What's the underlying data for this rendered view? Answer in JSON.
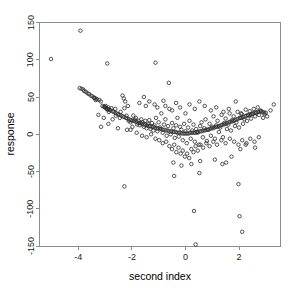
{
  "chart_data": {
    "type": "scatter",
    "title": "True index vs Response",
    "xlabel": "second index",
    "ylabel": "response",
    "xlim": [
      -5.45,
      3.55
    ],
    "ylim": [
      -150,
      150
    ],
    "xticks": [
      -4,
      -2,
      0,
      2
    ],
    "xtick_labels": [
      "-4",
      "-2",
      "0",
      "2"
    ],
    "yticks": [
      -150,
      -100,
      -50,
      0,
      50,
      100,
      150
    ],
    "ytick_labels": [
      "-150",
      "-100",
      "-50",
      "0",
      "50",
      "100",
      "150"
    ],
    "grid": false,
    "legend": null,
    "marker": "open-circle",
    "marker_color": "#2b2b2b",
    "points": [
      [
        -5.02,
        101
      ],
      [
        -3.92,
        139
      ],
      [
        -2.92,
        95
      ],
      [
        -1.12,
        96
      ],
      [
        -3.95,
        62
      ],
      [
        -3.88,
        61
      ],
      [
        -3.82,
        60
      ],
      [
        -3.78,
        58
      ],
      [
        -3.72,
        57
      ],
      [
        -3.66,
        55
      ],
      [
        -3.6,
        54
      ],
      [
        -3.54,
        52
      ],
      [
        -3.48,
        51
      ],
      [
        -3.42,
        49
      ],
      [
        -3.36,
        48
      ],
      [
        -3.3,
        47
      ],
      [
        -3.22,
        46
      ],
      [
        -3.16,
        44
      ],
      [
        -3.05,
        37
      ],
      [
        -3.0,
        36
      ],
      [
        -2.96,
        35
      ],
      [
        -2.92,
        34
      ],
      [
        -2.88,
        36
      ],
      [
        -2.84,
        33
      ],
      [
        -2.8,
        32
      ],
      [
        -2.76,
        35
      ],
      [
        -2.72,
        31
      ],
      [
        -2.68,
        30
      ],
      [
        -2.62,
        29
      ],
      [
        -2.58,
        28
      ],
      [
        -2.52,
        27
      ],
      [
        -2.46,
        26
      ],
      [
        -2.4,
        25
      ],
      [
        -2.34,
        24
      ],
      [
        -2.28,
        23
      ],
      [
        -2.22,
        22
      ],
      [
        -2.16,
        21
      ],
      [
        -2.1,
        20
      ],
      [
        -2.04,
        19
      ],
      [
        -1.98,
        18
      ],
      [
        -1.92,
        18
      ],
      [
        -1.86,
        17
      ],
      [
        -1.8,
        16
      ],
      [
        -1.74,
        15
      ],
      [
        -1.68,
        15
      ],
      [
        -1.62,
        14
      ],
      [
        -1.56,
        13
      ],
      [
        -1.5,
        13
      ],
      [
        -1.44,
        12
      ],
      [
        -1.38,
        11
      ],
      [
        -1.32,
        11
      ],
      [
        -1.26,
        10
      ],
      [
        -1.2,
        10
      ],
      [
        -1.14,
        9
      ],
      [
        -1.08,
        8
      ],
      [
        -1.02,
        8
      ],
      [
        -0.96,
        7
      ],
      [
        -0.9,
        7
      ],
      [
        -0.84,
        6
      ],
      [
        -0.78,
        6
      ],
      [
        -0.72,
        5
      ],
      [
        -0.66,
        5
      ],
      [
        -0.6,
        4
      ],
      [
        -0.54,
        4
      ],
      [
        -0.48,
        3
      ],
      [
        -0.42,
        3
      ],
      [
        -0.36,
        3
      ],
      [
        -0.3,
        2
      ],
      [
        -0.24,
        2
      ],
      [
        -0.18,
        2
      ],
      [
        -0.12,
        1
      ],
      [
        -0.06,
        1
      ],
      [
        0.0,
        1
      ],
      [
        0.06,
        1
      ],
      [
        0.12,
        1
      ],
      [
        0.18,
        2
      ],
      [
        0.24,
        2
      ],
      [
        0.3,
        2
      ],
      [
        0.36,
        2
      ],
      [
        0.42,
        3
      ],
      [
        0.48,
        3
      ],
      [
        0.54,
        4
      ],
      [
        0.6,
        4
      ],
      [
        0.66,
        5
      ],
      [
        0.72,
        5
      ],
      [
        0.78,
        6
      ],
      [
        0.84,
        6
      ],
      [
        0.9,
        7
      ],
      [
        0.96,
        8
      ],
      [
        1.02,
        8
      ],
      [
        1.08,
        9
      ],
      [
        1.14,
        10
      ],
      [
        1.2,
        10
      ],
      [
        1.26,
        11
      ],
      [
        1.32,
        12
      ],
      [
        1.38,
        13
      ],
      [
        1.44,
        13
      ],
      [
        1.5,
        14
      ],
      [
        1.56,
        15
      ],
      [
        1.62,
        16
      ],
      [
        1.68,
        17
      ],
      [
        1.74,
        17
      ],
      [
        1.8,
        18
      ],
      [
        1.86,
        19
      ],
      [
        1.92,
        20
      ],
      [
        1.98,
        21
      ],
      [
        2.04,
        22
      ],
      [
        2.1,
        22
      ],
      [
        2.16,
        23
      ],
      [
        2.22,
        24
      ],
      [
        2.28,
        25
      ],
      [
        2.34,
        26
      ],
      [
        2.4,
        26
      ],
      [
        2.46,
        27
      ],
      [
        2.52,
        28
      ],
      [
        2.58,
        29
      ],
      [
        2.64,
        29
      ],
      [
        2.7,
        30
      ],
      [
        2.76,
        30
      ],
      [
        2.82,
        31
      ],
      [
        2.88,
        30
      ],
      [
        2.94,
        29
      ],
      [
        3.0,
        29
      ],
      [
        3.18,
        32
      ],
      [
        3.3,
        40
      ],
      [
        -3.4,
        49
      ],
      [
        -3.35,
        46
      ],
      [
        -3.1,
        38
      ],
      [
        -3.02,
        37
      ],
      [
        -2.98,
        38
      ],
      [
        -2.94,
        34
      ],
      [
        -2.9,
        33
      ],
      [
        -2.86,
        30
      ],
      [
        -2.6,
        25
      ],
      [
        -2.45,
        22
      ],
      [
        -2.3,
        48
      ],
      [
        -2.28,
        35
      ],
      [
        -2.2,
        25
      ],
      [
        -2.12,
        18
      ],
      [
        -2.05,
        16
      ],
      [
        -1.95,
        25
      ],
      [
        -1.9,
        20
      ],
      [
        -1.85,
        22
      ],
      [
        -1.8,
        13
      ],
      [
        -1.75,
        18
      ],
      [
        -1.7,
        12
      ],
      [
        -1.65,
        20
      ],
      [
        -1.6,
        16
      ],
      [
        -1.55,
        10
      ],
      [
        -1.5,
        18
      ],
      [
        -1.45,
        8
      ],
      [
        -1.4,
        14
      ],
      [
        -1.35,
        19
      ],
      [
        -1.3,
        7
      ],
      [
        -1.25,
        15
      ],
      [
        -1.2,
        5
      ],
      [
        -1.15,
        12
      ],
      [
        -1.1,
        22
      ],
      [
        -1.05,
        4
      ],
      [
        -1.0,
        16
      ],
      [
        -0.95,
        9
      ],
      [
        -0.9,
        28
      ],
      [
        -0.85,
        2
      ],
      [
        -0.8,
        13
      ],
      [
        -0.75,
        20
      ],
      [
        -0.7,
        -2
      ],
      [
        -0.65,
        11
      ],
      [
        -0.6,
        34
      ],
      [
        -0.55,
        0
      ],
      [
        -0.5,
        15
      ],
      [
        -0.45,
        8
      ],
      [
        -0.4,
        -5
      ],
      [
        -0.35,
        12
      ],
      [
        -0.3,
        22
      ],
      [
        -0.25,
        -3
      ],
      [
        -0.2,
        10
      ],
      [
        -0.15,
        6
      ],
      [
        -0.1,
        -8
      ],
      [
        -0.05,
        14
      ],
      [
        0.0,
        4
      ],
      [
        0.05,
        -12
      ],
      [
        0.1,
        9
      ],
      [
        0.15,
        18
      ],
      [
        0.2,
        -6
      ],
      [
        0.25,
        5
      ],
      [
        0.3,
        13
      ],
      [
        0.35,
        -10
      ],
      [
        0.4,
        7
      ],
      [
        0.45,
        2
      ],
      [
        0.5,
        -14
      ],
      [
        0.55,
        11
      ],
      [
        0.6,
        16
      ],
      [
        0.65,
        -4
      ],
      [
        0.7,
        8
      ],
      [
        0.75,
        20
      ],
      [
        0.8,
        -9
      ],
      [
        0.85,
        6
      ],
      [
        0.9,
        14
      ],
      [
        0.95,
        -2
      ],
      [
        1.0,
        10
      ],
      [
        1.05,
        24
      ],
      [
        1.1,
        -6
      ],
      [
        1.15,
        12
      ],
      [
        1.2,
        18
      ],
      [
        1.25,
        3
      ],
      [
        1.3,
        9
      ],
      [
        1.35,
        26
      ],
      [
        1.4,
        -4
      ],
      [
        1.45,
        15
      ],
      [
        1.5,
        21
      ],
      [
        1.55,
        7
      ],
      [
        1.6,
        13
      ],
      [
        1.65,
        28
      ],
      [
        1.7,
        5
      ],
      [
        1.75,
        19
      ],
      [
        1.8,
        24
      ],
      [
        1.85,
        11
      ],
      [
        1.9,
        16
      ],
      [
        1.95,
        30
      ],
      [
        2.0,
        9
      ],
      [
        2.05,
        22
      ],
      [
        2.1,
        27
      ],
      [
        2.15,
        14
      ],
      [
        2.2,
        20
      ],
      [
        2.25,
        33
      ],
      [
        2.3,
        18
      ],
      [
        2.35,
        25
      ],
      [
        2.4,
        31
      ],
      [
        2.45,
        21
      ],
      [
        2.5,
        27
      ],
      [
        2.55,
        34
      ],
      [
        2.6,
        24
      ],
      [
        2.65,
        29
      ],
      [
        2.7,
        36
      ],
      [
        2.75,
        26
      ],
      [
        2.8,
        32
      ],
      [
        2.9,
        22
      ],
      [
        2.95,
        27
      ],
      [
        3.05,
        24
      ],
      [
        -2.35,
        52
      ],
      [
        -2.25,
        44
      ],
      [
        -2.15,
        38
      ],
      [
        -1.72,
        42
      ],
      [
        -1.55,
        50
      ],
      [
        -1.48,
        38
      ],
      [
        -1.35,
        44
      ],
      [
        -1.15,
        40
      ],
      [
        -1.05,
        36
      ],
      [
        -0.82,
        45
      ],
      [
        -0.75,
        38
      ],
      [
        -0.62,
        69
      ],
      [
        -0.5,
        32
      ],
      [
        -0.35,
        42
      ],
      [
        -0.2,
        36
      ],
      [
        0.0,
        28
      ],
      [
        0.15,
        40
      ],
      [
        0.35,
        34
      ],
      [
        0.52,
        44
      ],
      [
        0.72,
        38
      ],
      [
        0.95,
        32
      ],
      [
        1.15,
        36
      ],
      [
        1.42,
        30
      ],
      [
        1.62,
        34
      ],
      [
        1.88,
        44
      ],
      [
        2.08,
        28
      ],
      [
        -2.05,
        6
      ],
      [
        -1.82,
        2
      ],
      [
        -1.62,
        -2
      ],
      [
        -1.45,
        -4
      ],
      [
        -1.28,
        0
      ],
      [
        -1.12,
        -6
      ],
      [
        -0.98,
        -8
      ],
      [
        -0.85,
        -12
      ],
      [
        -0.72,
        -10
      ],
      [
        -0.6,
        -16
      ],
      [
        -0.5,
        -20
      ],
      [
        -0.42,
        -14
      ],
      [
        -0.34,
        -24
      ],
      [
        -0.26,
        -18
      ],
      [
        -0.18,
        -26
      ],
      [
        -0.1,
        -22
      ],
      [
        -0.02,
        -30
      ],
      [
        0.06,
        -26
      ],
      [
        0.14,
        -32
      ],
      [
        0.22,
        -20
      ],
      [
        0.3,
        -24
      ],
      [
        0.38,
        -16
      ],
      [
        0.46,
        -22
      ],
      [
        0.56,
        -14
      ],
      [
        0.66,
        -18
      ],
      [
        0.78,
        -12
      ],
      [
        0.9,
        -16
      ],
      [
        1.04,
        -10
      ],
      [
        1.18,
        -14
      ],
      [
        1.34,
        -8
      ],
      [
        1.5,
        -12
      ],
      [
        1.66,
        -6
      ],
      [
        1.82,
        -10
      ],
      [
        1.98,
        -14
      ],
      [
        2.12,
        -8
      ],
      [
        2.28,
        -12
      ],
      [
        2.42,
        -6
      ],
      [
        2.58,
        -10
      ],
      [
        2.74,
        -4
      ],
      [
        -0.45,
        -38
      ],
      [
        -0.15,
        -42
      ],
      [
        0.22,
        -40
      ],
      [
        0.55,
        -36
      ],
      [
        1.1,
        -34
      ],
      [
        1.38,
        -40
      ],
      [
        1.72,
        -30
      ],
      [
        2.05,
        -20
      ],
      [
        2.25,
        -14
      ],
      [
        2.6,
        -18
      ],
      [
        -2.28,
        -70
      ],
      [
        -0.42,
        -56
      ],
      [
        0.52,
        -52
      ],
      [
        1.52,
        -38
      ],
      [
        0.32,
        -103
      ],
      [
        1.98,
        -67
      ],
      [
        2.02,
        -110
      ],
      [
        2.12,
        -131
      ],
      [
        0.38,
        -148
      ],
      [
        -3.15,
        10
      ],
      [
        -2.88,
        14
      ],
      [
        -2.52,
        8
      ],
      [
        -2.18,
        6
      ],
      [
        -1.98,
        10
      ],
      [
        -2.42,
        30
      ],
      [
        -2.62,
        34
      ],
      [
        -2.72,
        20
      ],
      [
        -3.25,
        26
      ],
      [
        -3.05,
        22
      ]
    ]
  }
}
